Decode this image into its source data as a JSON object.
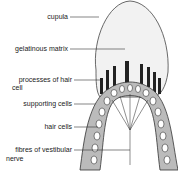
{
  "diagram": {
    "labels": {
      "cupula": "cupula",
      "gelatinous_matrix": "gelatinous matrix",
      "processes_line1": "processes of hair",
      "processes_line2": "cell",
      "supporting_cells": "supporting cells",
      "hair_cells": "hair cells",
      "fibres_line1": "fibres of vestibular",
      "fibres_line2": "nerve"
    },
    "colors": {
      "cupula_fill": "#f2f2f2",
      "outline": "#333333",
      "cells": "#555555"
    }
  }
}
